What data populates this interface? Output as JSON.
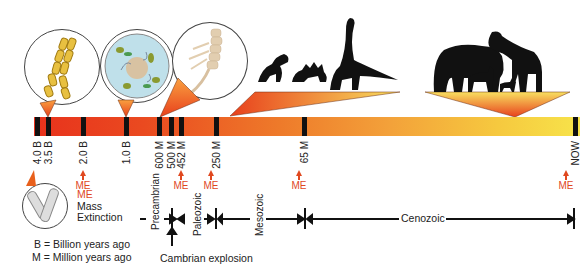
{
  "timeline": {
    "ticks": [
      {
        "label": "4.0 B",
        "x": 36
      },
      {
        "label": "3.5 B",
        "x": 46
      },
      {
        "label": "2.0 B",
        "x": 82
      },
      {
        "label": "1.0 B",
        "x": 125
      },
      {
        "label": "600 M",
        "x": 158
      },
      {
        "label": "500 M",
        "x": 170
      },
      {
        "label": "452 M",
        "x": 180
      },
      {
        "label": "250 M",
        "x": 215
      },
      {
        "label": "65 M",
        "x": 303
      },
      {
        "label": "NOW",
        "x": 572
      }
    ],
    "mass_extinction_label": "ME",
    "mass_extinctions": [
      {
        "x": 83
      },
      {
        "x": 181
      },
      {
        "x": 211
      },
      {
        "x": 299
      },
      {
        "x": 566
      }
    ]
  },
  "legend": {
    "me_label": "ME",
    "me_meaning_line1": "Mass",
    "me_meaning_line2": "Extinction",
    "b_meaning": "B = Billion years ago",
    "m_meaning": "M = Million years ago"
  },
  "eras": {
    "precambrian": "Precambrian",
    "paleozoic": "Paleozoic",
    "mesozoic": "Mesozoic",
    "cenozoic": "Cenozoic",
    "cambrian_explosion": "Cambrian explosion"
  },
  "illustrations": {
    "bacteria": "Filamentous bacteria chain",
    "eukaryote": "Eukaryotic cell",
    "invertebrate": "Early multicellular animal",
    "dinosaurs": "Dinosaurs silhouettes",
    "mammals": "Mammals silhouettes"
  },
  "colors": {
    "bar_start": "#e8321c",
    "bar_mid": "#ee7a2a",
    "bar_end": "#f7e34a",
    "me_color": "#e0481f",
    "tick_color": "#111111"
  }
}
